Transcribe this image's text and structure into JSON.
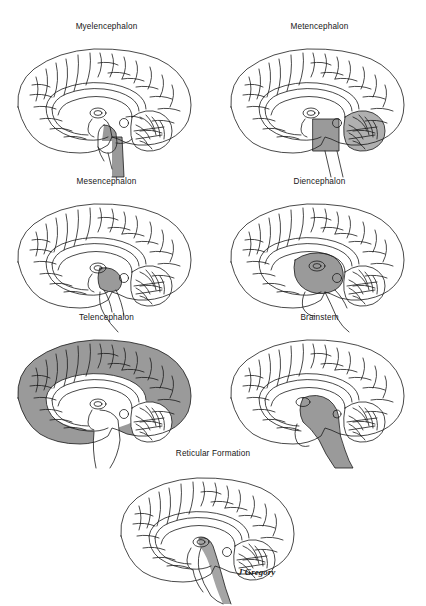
{
  "figure": {
    "title_hidden": "Divisions of the brain: midsagittal views",
    "signature": "J Gregory",
    "background_color": "#ffffff",
    "outline_color": "#1a1a1a",
    "shade_color": "#9a9a9a",
    "shade_color_light": "#b5b5b5"
  },
  "panels": [
    {
      "id": "myelencephalon",
      "label": "Myelencephalon",
      "row": 1,
      "col": 1,
      "highlight": "medulla-oblongata",
      "highlight_description": "lower brainstem / medulla shaded grey",
      "shaded": true
    },
    {
      "id": "metencephalon",
      "label": "Metencephalon",
      "row": 1,
      "col": 2,
      "highlight": "pons-and-cerebellum",
      "highlight_description": "pons block and cerebellum shaded grey",
      "shaded": true
    },
    {
      "id": "mesencephalon",
      "label": "Mesencephalon",
      "row": 2,
      "col": 1,
      "highlight": "midbrain",
      "highlight_description": "small midbrain wedge shaded grey",
      "shaded": true
    },
    {
      "id": "diencephalon",
      "label": "Diencephalon",
      "row": 2,
      "col": 2,
      "highlight": "thalamus-hypothalamus",
      "highlight_description": "thalamus and hypothalamus region shaded grey",
      "shaded": true
    },
    {
      "id": "telencephalon",
      "label": "Telencephalon",
      "row": 3,
      "col": 1,
      "highlight": "cerebral-cortex",
      "highlight_description": "entire cerebral hemisphere shaded grey",
      "shaded": true
    },
    {
      "id": "brainstem",
      "label": "Brainstem",
      "row": 3,
      "col": 2,
      "highlight": "full-brainstem",
      "highlight_description": "midbrain, pons and medulla shaded grey",
      "shaded": true
    },
    {
      "id": "reticular-formation",
      "label": "Reticular Formation",
      "row": 4,
      "col": 1,
      "highlight": "reticular-core",
      "highlight_description": "narrow grey band through brainstem core",
      "shaded": true
    }
  ]
}
